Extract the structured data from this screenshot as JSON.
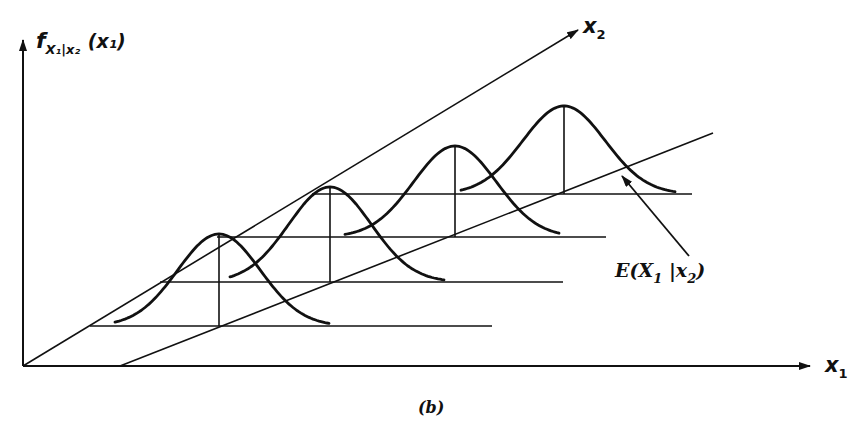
{
  "figure": {
    "caption": "(b)",
    "axes": {
      "vertical_label": {
        "main": "f",
        "subscript": "X₁|x₂",
        "argument": "(x₁)"
      },
      "x1_label": {
        "main": "x",
        "subscript": "1"
      },
      "x2_label": {
        "main": "x",
        "subscript": "2"
      }
    },
    "regression_line_label": {
      "text": "E(X",
      "sub1": "1",
      "mid": " |x",
      "sub2": "2",
      "close": ")"
    },
    "colors": {
      "ink": "#111111",
      "background": "#ffffff"
    }
  },
  "diagram": {
    "origin": [
      23,
      366
    ],
    "x1_axis_end": [
      810,
      366
    ],
    "vertical_axis_end": [
      23,
      40
    ],
    "x2_axis_end": [
      578,
      30
    ],
    "regression_line": {
      "start": [
        120,
        366
      ],
      "end": [
        713,
        133
      ]
    },
    "conditional_densities": [
      {
        "index": 1,
        "baseline_y": 326,
        "baseline_x": [
          90,
          492
        ],
        "peak": [
          219,
          234
        ],
        "tails_x": [
          115,
          330
        ]
      },
      {
        "index": 2,
        "baseline_y": 282,
        "baseline_x": [
          160,
          563
        ],
        "peak": [
          330,
          187
        ],
        "tails_x": [
          230,
          445
        ]
      },
      {
        "index": 3,
        "baseline_y": 237,
        "baseline_x": [
          217,
          606
        ],
        "peak": [
          455,
          146
        ],
        "tails_x": [
          345,
          560
        ]
      },
      {
        "index": 4,
        "baseline_y": 194,
        "baseline_x": [
          312,
          692
        ],
        "peak": [
          564,
          106
        ],
        "tails_x": [
          461,
          675
        ]
      }
    ]
  }
}
